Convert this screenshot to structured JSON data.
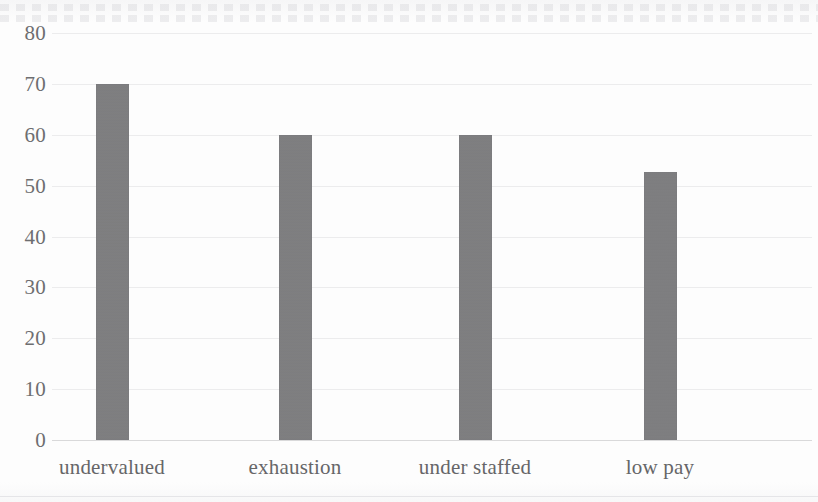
{
  "chart_data": {
    "type": "bar",
    "title": "",
    "subtitle": "",
    "xlabel": "",
    "ylabel": "",
    "categories": [
      "undervalued",
      "exhaustion",
      "under staffed",
      "low pay"
    ],
    "values": [
      70,
      60,
      60,
      52.6
    ],
    "series": [
      {
        "name": "",
        "values": [
          70,
          60,
          60,
          52.6
        ]
      }
    ],
    "ylim": [
      0,
      80
    ],
    "ytick_step": 10,
    "yticks": [
      "80",
      "70",
      "60",
      "50",
      "40",
      "30",
      "20",
      "10",
      "0"
    ],
    "ytick_values": [
      80,
      70,
      60,
      50,
      40,
      30,
      20,
      10,
      0
    ],
    "grid": true,
    "grid_axis": "y",
    "legend": false,
    "legend_position": "none",
    "bar_color": "#7e7e80",
    "grid_color": "#ececed",
    "axis_text_color": "#6e6e70",
    "background_color": "#fdfdfd"
  },
  "axis": {
    "y_ticks": [
      {
        "label": "80",
        "value": 80
      },
      {
        "label": "70",
        "value": 70
      },
      {
        "label": "60",
        "value": 60
      },
      {
        "label": "50",
        "value": 50
      },
      {
        "label": "40",
        "value": 40
      },
      {
        "label": "30",
        "value": 30
      },
      {
        "label": "20",
        "value": 20
      },
      {
        "label": "10",
        "value": 10
      },
      {
        "label": "0",
        "value": 0
      }
    ]
  },
  "bars": [
    {
      "label": "undervalued",
      "value": 70,
      "center_x": 112
    },
    {
      "label": "exhaustion",
      "value": 60,
      "center_x": 295
    },
    {
      "label": "under staffed",
      "value": 60,
      "center_x": 475
    },
    {
      "label": "low pay",
      "value": 52.6,
      "center_x": 660
    }
  ]
}
